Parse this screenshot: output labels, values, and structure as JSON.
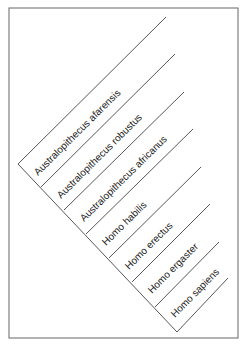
{
  "diagram": {
    "type": "cladogram",
    "colors": {
      "line": "#444444",
      "border": "#666666",
      "text": "#222222",
      "background": "#ffffff"
    },
    "border": {
      "x": 9,
      "y": 8,
      "width": 229,
      "height": 330
    },
    "trunk": {
      "x1": 18,
      "y1": 164,
      "x2": 177,
      "y2": 332
    },
    "taxa": [
      {
        "label": "Australopithecus afarensis",
        "base": [
          18,
          164
        ],
        "tip": [
          166,
          17
        ],
        "text_at": [
          38,
          176
        ]
      },
      {
        "label": "Australopithecus robustus",
        "base": [
          41,
          187
        ],
        "tip": [
          175,
          54
        ],
        "text_at": [
          61,
          199
        ]
      },
      {
        "label": "Australopithecus africanus",
        "base": [
          64,
          210
        ],
        "tip": [
          184,
          92
        ],
        "text_at": [
          84,
          222
        ]
      },
      {
        "label": "Homo habilis",
        "base": [
          86,
          234
        ],
        "tip": [
          193,
          129
        ],
        "text_at": [
          106,
          246
        ]
      },
      {
        "label": "Homo erectus",
        "base": [
          109,
          258
        ],
        "tip": [
          201,
          167
        ],
        "text_at": [
          129,
          270
        ]
      },
      {
        "label": "Homo ergaster",
        "base": [
          132,
          282
        ],
        "tip": [
          210,
          204
        ],
        "text_at": [
          152,
          294
        ]
      },
      {
        "label": "Homo sapiens",
        "base": [
          155,
          307
        ],
        "tip": [
          219,
          242
        ],
        "text_at": [
          175,
          318
        ]
      }
    ],
    "last_tip": {
      "base": [
        177,
        332
      ],
      "tip": [
        228,
        278
      ]
    }
  }
}
